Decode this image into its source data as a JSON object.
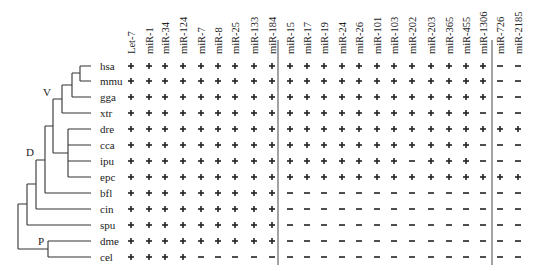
{
  "figure": {
    "columns_group1": [
      "Let-7",
      "miR-1",
      "miR-34",
      "miR-124",
      "miR-7",
      "miR-8",
      "miR-25",
      "miR-133",
      "miR-184"
    ],
    "columns_group2": [
      "miR-15",
      "miR-17",
      "miR-19",
      "miR-24",
      "miR-26",
      "miR-101",
      "miR-103",
      "miR-202",
      "miR-203",
      "miR-365",
      "miR-455",
      "miR-1306"
    ],
    "columns_group3": [
      "miR-726",
      "miR-2185"
    ],
    "species": [
      "hsa",
      "mmu",
      "gga",
      "xtr",
      "dre",
      "cca",
      "ipu",
      "epc",
      "bfl",
      "cin",
      "spu",
      "dme",
      "cel"
    ],
    "node_labels": {
      "V": "V",
      "D": "D",
      "P": "P"
    },
    "symbols": {
      "present": "+",
      "absent": "-"
    }
  },
  "chart_data": {
    "type": "table",
    "title": "",
    "columns": [
      "Let-7",
      "miR-1",
      "miR-34",
      "miR-124",
      "miR-7",
      "miR-8",
      "miR-25",
      "miR-133",
      "miR-184",
      "miR-15",
      "miR-17",
      "miR-19",
      "miR-24",
      "miR-26",
      "miR-101",
      "miR-103",
      "miR-202",
      "miR-203",
      "miR-365",
      "miR-455",
      "miR-1306",
      "miR-726",
      "miR-2185"
    ],
    "rows": [
      {
        "species": "hsa",
        "values": [
          "+",
          "+",
          "+",
          "+",
          "+",
          "+",
          "+",
          "+",
          "+",
          "+",
          "+",
          "+",
          "+",
          "+",
          "+",
          "+",
          "+",
          "+",
          "+",
          "+",
          "+",
          "-",
          "-"
        ]
      },
      {
        "species": "mmu",
        "values": [
          "+",
          "+",
          "+",
          "+",
          "+",
          "+",
          "+",
          "+",
          "+",
          "+",
          "+",
          "+",
          "+",
          "+",
          "+",
          "+",
          "+",
          "+",
          "+",
          "+",
          "+",
          "-",
          "-"
        ]
      },
      {
        "species": "gga",
        "values": [
          "+",
          "+",
          "+",
          "+",
          "+",
          "+",
          "+",
          "+",
          "+",
          "+",
          "+",
          "+",
          "+",
          "+",
          "+",
          "+",
          "+",
          "+",
          "+",
          "+",
          "+",
          "-",
          "-"
        ]
      },
      {
        "species": "xtr",
        "values": [
          "+",
          "+",
          "+",
          "+",
          "+",
          "+",
          "+",
          "+",
          "+",
          "+",
          "+",
          "+",
          "+",
          "+",
          "+",
          "+",
          "+",
          "+",
          "+",
          "+",
          "-",
          "-",
          "-"
        ]
      },
      {
        "species": "dre",
        "values": [
          "+",
          "+",
          "+",
          "+",
          "+",
          "+",
          "+",
          "+",
          "+",
          "+",
          "+",
          "+",
          "+",
          "+",
          "+",
          "+",
          "+",
          "+",
          "+",
          "+",
          "+",
          "+",
          "+"
        ]
      },
      {
        "species": "cca",
        "values": [
          "+",
          "+",
          "+",
          "+",
          "+",
          "+",
          "+",
          "+",
          "+",
          "+",
          "+",
          "+",
          "+",
          "+",
          "+",
          "+",
          "+",
          "+",
          "+",
          "+",
          "-",
          "-",
          "-"
        ]
      },
      {
        "species": "ipu",
        "values": [
          "+",
          "+",
          "+",
          "+",
          "+",
          "+",
          "+",
          "+",
          "+",
          "+",
          "+",
          "+",
          "+",
          "+",
          "+",
          "+",
          "-",
          "+",
          "+",
          "+",
          "-",
          "-",
          "-"
        ]
      },
      {
        "species": "epc",
        "values": [
          "+",
          "+",
          "+",
          "+",
          "+",
          "+",
          "+",
          "+",
          "+",
          "+",
          "+",
          "+",
          "+",
          "+",
          "+",
          "+",
          "+",
          "+",
          "+",
          "+",
          "+",
          "+",
          "+"
        ]
      },
      {
        "species": "bfl",
        "values": [
          "+",
          "+",
          "+",
          "+",
          "+",
          "+",
          "+",
          "+",
          "+",
          "-",
          "-",
          "-",
          "-",
          "-",
          "-",
          "-",
          "-",
          "-",
          "-",
          "-",
          "-",
          "-",
          "-"
        ]
      },
      {
        "species": "cin",
        "values": [
          "+",
          "+",
          "+",
          "+",
          "+",
          "+",
          "+",
          "+",
          "+",
          "-",
          "-",
          "-",
          "-",
          "-",
          "-",
          "-",
          "-",
          "-",
          "-",
          "-",
          "-",
          "-",
          "-"
        ]
      },
      {
        "species": "spu",
        "values": [
          "+",
          "+",
          "+",
          "+",
          "+",
          "+",
          "+",
          "+",
          "+",
          "-",
          "-",
          "-",
          "-",
          "-",
          "-",
          "-",
          "-",
          "-",
          "-",
          "-",
          "-",
          "-",
          "-"
        ]
      },
      {
        "species": "dme",
        "values": [
          "+",
          "+",
          "+",
          "+",
          "+",
          "+",
          "+",
          "+",
          "+",
          "-",
          "-",
          "-",
          "-",
          "-",
          "-",
          "-",
          "-",
          "-",
          "-",
          "-",
          "-",
          "-",
          "-"
        ]
      },
      {
        "species": "cel",
        "values": [
          "+",
          "+",
          "+",
          "+",
          "-",
          "-",
          "-",
          "-",
          "-",
          "-",
          "-",
          "-",
          "-",
          "-",
          "-",
          "-",
          "-",
          "-",
          "-",
          "-",
          "-",
          "-",
          "-"
        ]
      }
    ],
    "tree_nodes": [
      "V",
      "D",
      "P"
    ],
    "legend": {
      "+": "present",
      "-": "absent"
    }
  }
}
